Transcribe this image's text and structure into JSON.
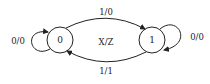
{
  "diagram": {
    "type": "state-machine",
    "center_label": "X/Z",
    "states": [
      {
        "id": "s0",
        "label": "0"
      },
      {
        "id": "s1",
        "label": "1"
      }
    ],
    "transitions": [
      {
        "from": "0",
        "to": "1",
        "label": "1/0"
      },
      {
        "from": "1",
        "to": "0",
        "label": "1/1"
      },
      {
        "from": "0",
        "to": "0",
        "label": "0/0"
      },
      {
        "from": "1",
        "to": "1",
        "label": "0/0"
      }
    ]
  }
}
